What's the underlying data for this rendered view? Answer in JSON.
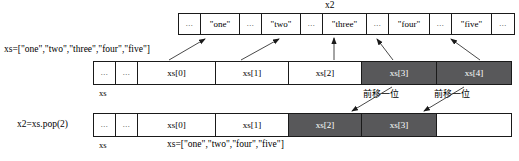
{
  "diagram": {
    "title_label": "x2",
    "left_labels": {
      "xs_init": "xs=[\"one\",\"two\",\"three\",\"four\",\"five\"]",
      "pop_call": "x2=xs.pop(2)"
    },
    "under_labels": {
      "mid_xs": "xs",
      "bot_xs": "xs",
      "xs_result": "xs=[\"one\",\"two\",\"four\",\"five\"]"
    },
    "annotations": [
      {
        "text": "前移一位",
        "x": 363,
        "y": 89
      },
      {
        "text": "前移一位",
        "x": 434,
        "y": 89
      }
    ],
    "top_row": {
      "name": "x2-values-row",
      "cells": [
        {
          "text": "...",
          "w": 22,
          "kind": "ellipsis"
        },
        {
          "text": "\"one\"",
          "w": 39,
          "kind": "value"
        },
        {
          "text": "...",
          "w": 22,
          "kind": "ellipsis"
        },
        {
          "text": "\"two\"",
          "w": 39,
          "kind": "value"
        },
        {
          "text": "...",
          "w": 22,
          "kind": "ellipsis"
        },
        {
          "text": "\"three\"",
          "w": 44,
          "kind": "value"
        },
        {
          "text": "...",
          "w": 22,
          "kind": "ellipsis"
        },
        {
          "text": "\"four\"",
          "w": 41,
          "kind": "value"
        },
        {
          "text": "...",
          "w": 22,
          "kind": "ellipsis"
        },
        {
          "text": "\"five\"",
          "w": 40,
          "kind": "value"
        },
        {
          "text": "...",
          "w": 22,
          "kind": "ellipsis"
        }
      ]
    },
    "mid_row": {
      "name": "xs-before-pop-row",
      "cells": [
        {
          "text": "...",
          "w": 22,
          "kind": "ellipsis",
          "dark": false
        },
        {
          "text": "...",
          "w": 22,
          "kind": "ellipsis",
          "dark": false
        },
        {
          "text": "xs[0]",
          "w": 78,
          "kind": "slot",
          "dark": false
        },
        {
          "text": "xs[1]",
          "w": 73,
          "kind": "slot",
          "dark": false
        },
        {
          "text": "xs[2]",
          "w": 73,
          "kind": "slot",
          "dark": false
        },
        {
          "text": "xs[3]",
          "w": 75,
          "kind": "slot",
          "dark": true
        },
        {
          "text": "xs[4]",
          "w": 74,
          "kind": "slot",
          "dark": true
        }
      ]
    },
    "bot_row": {
      "name": "xs-after-pop-row",
      "cells": [
        {
          "text": "...",
          "w": 22,
          "kind": "ellipsis",
          "dark": false
        },
        {
          "text": "...",
          "w": 22,
          "kind": "ellipsis",
          "dark": false
        },
        {
          "text": "xs[0]",
          "w": 78,
          "kind": "slot",
          "dark": false
        },
        {
          "text": "xs[1]",
          "w": 73,
          "kind": "slot",
          "dark": false
        },
        {
          "text": "xs[2]",
          "w": 73,
          "kind": "slot",
          "dark": true
        },
        {
          "text": "xs[3]",
          "w": 75,
          "kind": "slot",
          "dark": true
        },
        {
          "text": "",
          "w": 74,
          "kind": "empty",
          "dark": false
        }
      ]
    },
    "colors": {
      "border": "#1a1a1a",
      "highlight_fill": "#58585a",
      "highlight_text": "#ffffff",
      "background": "#ffffff"
    }
  }
}
